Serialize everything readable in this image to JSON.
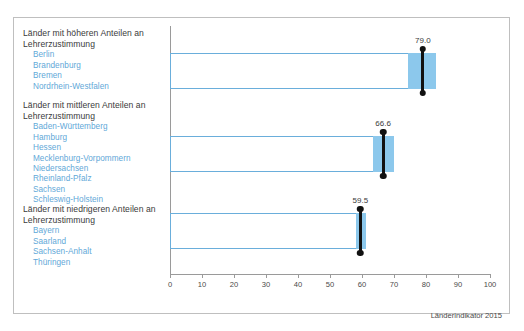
{
  "top_clip_text": "",
  "source_note": "Länderindikator 2015",
  "axis": {
    "min": 0,
    "max": 100,
    "ticks": [
      0,
      10,
      20,
      30,
      40,
      50,
      60,
      70,
      80,
      90,
      100
    ]
  },
  "groups": [
    {
      "title": "Länder mit höheren Anteilen an\nLehrerzustimmung",
      "states": [
        "Berlin",
        "Brandenburg",
        "Bremen",
        "Nordrhein-Westfalen"
      ],
      "value": 79.0,
      "value_label": "79.0",
      "band_low": 74.5,
      "band_high": 83.0
    },
    {
      "title": "Länder mit mittleren Anteilen an\nLehrerzustimmung",
      "states": [
        "Baden-Württemberg",
        "Hamburg",
        "Hessen",
        "Mecklenburg-Vorpommern",
        "Niedersachsen",
        "Rheinland-Pfalz",
        "Sachsen",
        "Schleswig-Holstein"
      ],
      "value": 66.6,
      "value_label": "66.6",
      "band_low": 63.3,
      "band_high": 70.0
    },
    {
      "title": "Länder mit niedrigeren Anteilen an\nLehrerzustimmung",
      "states": [
        "Bayern",
        "Saarland",
        "Sachsen-Anhalt",
        "Thüringen"
      ],
      "value": 59.5,
      "value_label": "59.5",
      "band_low": 58.0,
      "band_high": 61.2
    }
  ],
  "colors": {
    "bar_outline": "#6aaedb",
    "bar_fill": "#8cc8ec",
    "state_text": "#5fa8d8",
    "marker": "#111111",
    "frame": "#bfbfbf"
  },
  "chart_data": {
    "type": "bar",
    "title": "",
    "subtitle": "",
    "xlabel": "",
    "ylabel": "",
    "categories": [
      "Länder mit höheren Anteilen an Lehrerzustimmung",
      "Länder mit mittleren Anteilen an Lehrerzustimmung",
      "Länder mit niedrigeren Anteilen an Lehrerzustimmung"
    ],
    "values": [
      79.0,
      66.6,
      59.5
    ],
    "data_labels": [
      "79.0",
      "66.6",
      "59.5"
    ],
    "series": [
      {
        "name": "Lehrerzustimmung (%)",
        "values": [
          79.0,
          66.6,
          59.5
        ]
      }
    ],
    "bands": [
      {
        "category": "höhere Anteile",
        "low": 74.5,
        "high": 83.0
      },
      {
        "category": "mittlere Anteile",
        "low": 63.3,
        "high": 70.0
      },
      {
        "category": "niedrigere Anteile",
        "low": 58.0,
        "high": 61.2
      }
    ],
    "orientation": "horizontal",
    "xlim": [
      0,
      100
    ],
    "xticks": [
      0,
      10,
      20,
      30,
      40,
      50,
      60,
      70,
      80,
      90,
      100
    ],
    "grid": false,
    "legend": "none",
    "annotations": [
      "Länderindikator 2015"
    ],
    "group_members": {
      "höhere Anteile": [
        "Berlin",
        "Brandenburg",
        "Bremen",
        "Nordrhein-Westfalen"
      ],
      "mittlere Anteile": [
        "Baden-Württemberg",
        "Hamburg",
        "Hessen",
        "Mecklenburg-Vorpommern",
        "Niedersachsen",
        "Rheinland-Pfalz",
        "Sachsen",
        "Schleswig-Holstein"
      ],
      "niedrigere Anteile": [
        "Bayern",
        "Saarland",
        "Sachsen-Anhalt",
        "Thüringen"
      ]
    }
  }
}
